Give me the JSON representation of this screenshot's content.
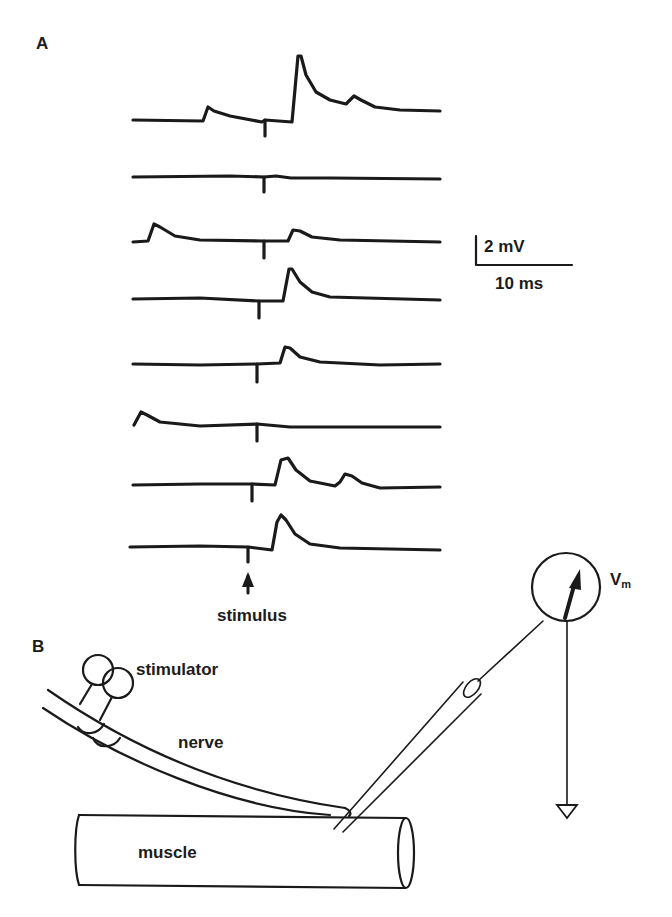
{
  "panel_a": {
    "label": "A",
    "scale_bar": {
      "voltage_label": "2 mV",
      "time_label": "10 ms"
    },
    "stimulus_label": "stimulus",
    "traces": [
      {
        "index": 1,
        "baseline_y": 120,
        "stim_x": 265,
        "description": "small early EPSP at x~205, large spike at x~297, small late EPSP at x~352"
      },
      {
        "index": 2,
        "baseline_y": 178,
        "stim_x": 264,
        "description": "flat, no response"
      },
      {
        "index": 3,
        "baseline_y": 241,
        "stim_x": 264,
        "description": "early EPSP at x~153, small EPSP after stimulus at x~290"
      },
      {
        "index": 4,
        "baseline_y": 299,
        "stim_x": 259,
        "description": "EPSP after stimulus at x~290"
      },
      {
        "index": 5,
        "baseline_y": 364,
        "stim_x": 257,
        "description": "EPSP after stimulus at x~285"
      },
      {
        "index": 6,
        "baseline_y": 427,
        "stim_x": 257,
        "description": "early EPSP at x~142, no evoked response"
      },
      {
        "index": 7,
        "baseline_y": 484,
        "stim_x": 252,
        "description": "EPSP at x~285, second EPSP at x~352"
      },
      {
        "index": 8,
        "baseline_y": 548,
        "stim_x": 248,
        "description": "EPSP at x~282"
      }
    ]
  },
  "panel_b": {
    "label": "B",
    "labels": {
      "stimulator": "stimulator",
      "nerve": "nerve",
      "muscle": "muscle",
      "voltmeter": "V",
      "voltmeter_sub": "m"
    }
  },
  "colors": {
    "ink": "#1a1a1a",
    "background": "#ffffff"
  }
}
